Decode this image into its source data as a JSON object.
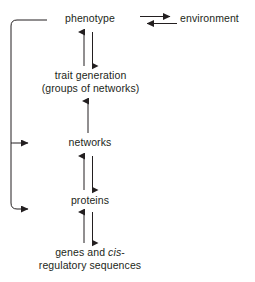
{
  "diagram": {
    "background_color": "#ffffff",
    "stroke_color": "#231f20",
    "text_color": "#231f20",
    "nodes": [
      {
        "id": "phenotype",
        "label": "phenotype"
      },
      {
        "id": "environment",
        "label": "environment"
      },
      {
        "id": "trait",
        "line1": "trait generation",
        "line2": "(groups of networks)"
      },
      {
        "id": "networks",
        "label": "networks"
      },
      {
        "id": "proteins",
        "label": "proteins"
      },
      {
        "id": "genes",
        "line1": "genes and ",
        "line1_italic": "cis",
        "line1_tail": "-",
        "line2": "regulatory sequences"
      }
    ],
    "edges": [
      {
        "from": "phenotype",
        "to": "environment",
        "direction": "right"
      },
      {
        "from": "environment",
        "to": "phenotype",
        "direction": "left"
      },
      {
        "from": "trait",
        "to": "phenotype",
        "direction": "up"
      },
      {
        "from": "phenotype",
        "to": "trait",
        "direction": "down"
      },
      {
        "from": "networks",
        "to": "trait",
        "direction": "up"
      },
      {
        "from": "proteins",
        "to": "networks",
        "direction": "up"
      },
      {
        "from": "networks",
        "to": "proteins",
        "direction": "down"
      },
      {
        "from": "genes",
        "to": "proteins",
        "direction": "up"
      },
      {
        "from": "proteins",
        "to": "genes",
        "direction": "down"
      },
      {
        "from": "phenotype",
        "to": "networks",
        "direction": "feedback-left"
      },
      {
        "from": "phenotype",
        "to": "proteins",
        "direction": "feedback-left"
      }
    ]
  }
}
